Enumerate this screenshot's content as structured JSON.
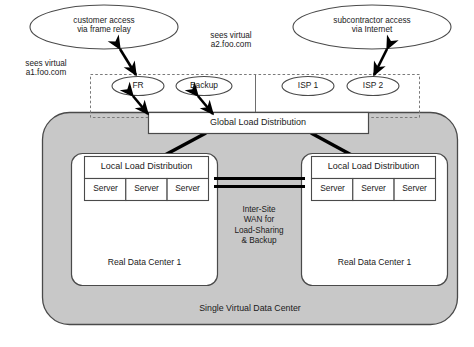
{
  "diagram": {
    "colors": {
      "gray_fill": "#c8c8c8",
      "white_fill": "#ffffff",
      "stroke": "#3c3c3c",
      "text": "#1a1a1a",
      "thick_link": "#000000"
    },
    "clouds": [
      {
        "id": "customer",
        "label": "customer access\nvia frame relay"
      },
      {
        "id": "subcontractor",
        "label": "subcontractor access\nvia Internet"
      }
    ],
    "annotations": [
      {
        "id": "a1",
        "label": "sees virtual\na1.foo.com"
      },
      {
        "id": "a2",
        "label": "sees virtual\na2.foo.com"
      }
    ],
    "access_nodes": [
      {
        "id": "fr",
        "label": "FR"
      },
      {
        "id": "backup",
        "label": "Backup"
      },
      {
        "id": "isp1",
        "label": "ISP 1"
      },
      {
        "id": "isp2",
        "label": "ISP 2"
      }
    ],
    "global_box": {
      "label": "Global Load Distribution"
    },
    "data_centers": [
      {
        "id": "dc-left",
        "name": "Real Data Center 1",
        "local_box": "Local Load Distribution",
        "servers": [
          "Server",
          "Server",
          "Server"
        ]
      },
      {
        "id": "dc-right",
        "name": "Real Data Center 1",
        "local_box": "Local Load Distribution",
        "servers": [
          "Server",
          "Server",
          "Server"
        ]
      }
    ],
    "wan": {
      "label": "Inter-Site\nWAN for\nLoad-Sharing\n& Backup"
    },
    "virtual_dc": {
      "label": "Single Virtual Data Center"
    }
  }
}
